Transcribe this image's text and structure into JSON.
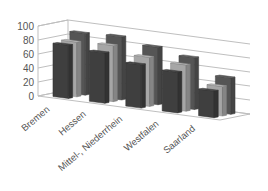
{
  "chart_data": {
    "type": "bar",
    "variant": "3d-clustered-column",
    "title": "",
    "xlabel": "",
    "ylabel": "",
    "ylim": [
      0,
      100
    ],
    "yticks": [
      0,
      20,
      40,
      60,
      80,
      100
    ],
    "grid": true,
    "legend": "none",
    "categories": [
      "Bremen",
      "Hessen",
      "Mittel-, Niederrhein",
      "Westfalen",
      "Saarland"
    ],
    "series": [
      {
        "name": "Series 3 (back)",
        "color": "#555555",
        "values": [
          88,
          90,
          82,
          74,
          52
        ]
      },
      {
        "name": "Series 2 (middle)",
        "color": "#a6a6a6",
        "values": [
          78,
          80,
          70,
          66,
          42
        ]
      },
      {
        "name": "Series 1 (front)",
        "color": "#3f3f3f",
        "values": [
          76,
          72,
          62,
          58,
          38
        ]
      }
    ]
  },
  "colors": {
    "front": "#3f3f3f",
    "middle": "#a6a6a6",
    "back": "#555555",
    "grid": "#bfbfbf",
    "text": "#555555"
  }
}
